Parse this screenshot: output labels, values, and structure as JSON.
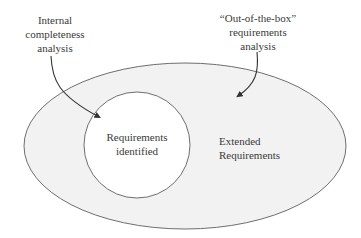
{
  "diagram": {
    "type": "nested-set",
    "colors": {
      "outer_fill": "#f2f2f2",
      "inner_fill": "#ffffff",
      "stroke": "#6e6e6e",
      "arrow": "#333333",
      "text": "#3a3a3a"
    },
    "annotations": {
      "internal": {
        "lines": [
          "Internal",
          "completeness",
          "analysis"
        ],
        "points_to": "Requirements identified"
      },
      "out_of_box": {
        "lines": [
          "“Out-of-the-box”",
          "requirements",
          "analysis"
        ],
        "points_to": "Extended Requirements"
      }
    },
    "regions": {
      "inner": {
        "lines": [
          "Requirements",
          "identified"
        ]
      },
      "outer": {
        "lines": [
          "Extended",
          "Requirements"
        ]
      }
    }
  }
}
